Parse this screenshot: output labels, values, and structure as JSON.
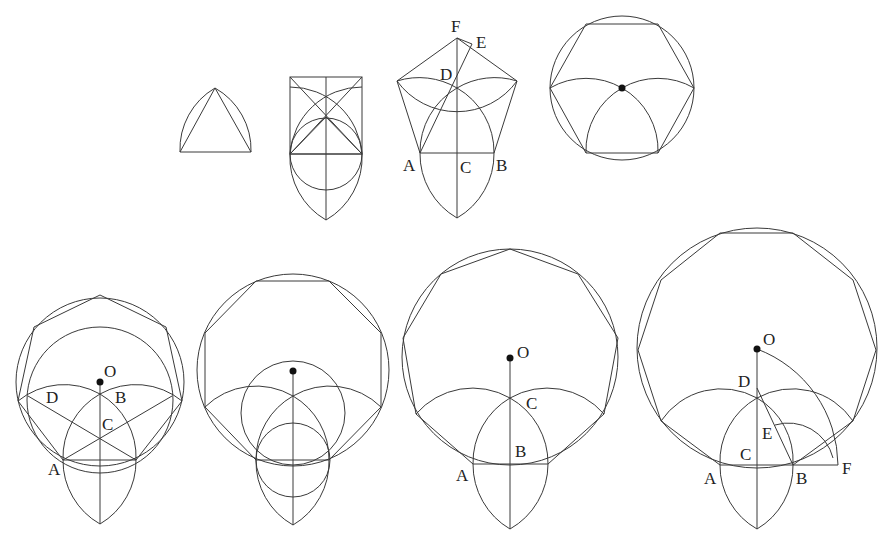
{
  "figures": [
    {
      "id": "triangle",
      "sides": 3,
      "labels": []
    },
    {
      "id": "square",
      "sides": 4,
      "labels": []
    },
    {
      "id": "pentagon",
      "sides": 5,
      "labels": [
        "A",
        "B",
        "C",
        "D",
        "E",
        "F"
      ]
    },
    {
      "id": "hexagon",
      "sides": 6,
      "labels": []
    },
    {
      "id": "heptagon",
      "sides": 7,
      "labels": [
        "O",
        "D",
        "B",
        "C",
        "A"
      ]
    },
    {
      "id": "octagon",
      "sides": 8,
      "labels": []
    },
    {
      "id": "nonagon",
      "sides": 9,
      "labels": [
        "O",
        "C",
        "B",
        "A"
      ]
    },
    {
      "id": "decagon",
      "sides": 10,
      "labels": [
        "O",
        "D",
        "E",
        "C",
        "A",
        "B",
        "F"
      ]
    }
  ],
  "labels": {
    "f3": {
      "A": "A",
      "B": "B",
      "C": "C",
      "D": "D",
      "E": "E",
      "F": "F"
    },
    "f5": {
      "O": "O",
      "D": "D",
      "B": "B",
      "C": "C",
      "A": "A"
    },
    "f7": {
      "O": "O",
      "C": "C",
      "B": "B",
      "A": "A"
    },
    "f8": {
      "O": "O",
      "D": "D",
      "E": "E",
      "C": "C",
      "A": "A",
      "B": "B",
      "F": "F"
    }
  },
  "colors": {
    "line": "#3a3a3a",
    "background": "#ffffff"
  }
}
